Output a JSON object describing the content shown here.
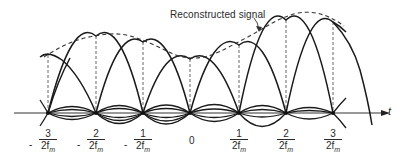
{
  "figure": {
    "annotation": "Reconstructed signal",
    "axis_label": "t",
    "ticks": [
      {
        "sign": "-",
        "numerator": "3",
        "denominator": "2f",
        "subscript": "m"
      },
      {
        "sign": "-",
        "numerator": "2",
        "denominator": "2f",
        "subscript": "m"
      },
      {
        "sign": "-",
        "numerator": "1",
        "denominator": "2f",
        "subscript": "m"
      },
      {
        "sign": "",
        "numerator": "0",
        "denominator": "",
        "subscript": ""
      },
      {
        "sign": "",
        "numerator": "1",
        "denominator": "2f",
        "subscript": "m"
      },
      {
        "sign": "",
        "numerator": "2",
        "denominator": "2f",
        "subscript": "m"
      },
      {
        "sign": "",
        "numerator": "3",
        "denominator": "2f",
        "subscript": "m"
      }
    ],
    "samples": [
      {
        "x": 48,
        "peak_y": 55
      },
      {
        "x": 96,
        "peak_y": 36
      },
      {
        "x": 143,
        "peak_y": 42
      },
      {
        "x": 190,
        "peak_y": 59
      },
      {
        "x": 239,
        "peak_y": 45
      },
      {
        "x": 286,
        "peak_y": 20
      },
      {
        "x": 333,
        "peak_y": 22
      }
    ],
    "axis_y": 113,
    "line_color": "#1a1a1a",
    "dash_color": "#444444"
  }
}
